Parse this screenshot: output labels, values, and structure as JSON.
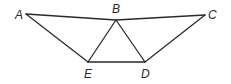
{
  "diagram": {
    "title": "",
    "points": [
      {
        "id": "A",
        "label": "A",
        "x": 26,
        "y": 14,
        "lx": 15,
        "ly": 19
      },
      {
        "id": "B",
        "label": "B",
        "x": 116,
        "y": 20,
        "lx": 112,
        "ly": 13
      },
      {
        "id": "C",
        "label": "C",
        "x": 205,
        "y": 15,
        "lx": 208,
        "ly": 19
      },
      {
        "id": "E",
        "label": "E",
        "x": 88,
        "y": 62,
        "lx": 84,
        "ly": 78
      },
      {
        "id": "D",
        "label": "D",
        "x": 145,
        "y": 62,
        "lx": 141,
        "ly": 78
      }
    ],
    "segments": [
      [
        "A",
        "B"
      ],
      [
        "B",
        "C"
      ],
      [
        "A",
        "E"
      ],
      [
        "E",
        "B"
      ],
      [
        "B",
        "D"
      ],
      [
        "D",
        "C"
      ],
      [
        "E",
        "D"
      ]
    ],
    "colors": {
      "stroke": "#2a2a2a",
      "background": "#ffffff"
    }
  }
}
